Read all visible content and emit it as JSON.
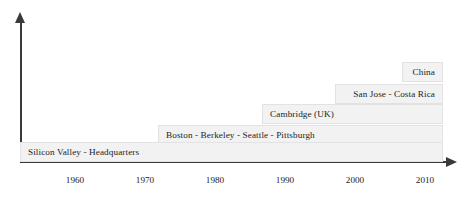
{
  "chart_data": {
    "type": "bar",
    "title": "",
    "xlabel": "",
    "ylabel": "",
    "orientation": "horizontal-stacked-staircase",
    "grid": false,
    "legend": false,
    "xlim": [
      1955,
      2015
    ],
    "x_ticks": [
      "1960",
      "1970",
      "1980",
      "1990",
      "2000",
      "2010"
    ],
    "categories": [
      "Silicon Valley - Headquarters",
      "Boston - Berkeley - Seattle - Pittsburgh",
      "Cambridge (UK)",
      "San Jose - Costa Rica",
      "China"
    ],
    "series": [
      {
        "name": "expansion-bands",
        "values": [
          {
            "label": "Silicon Valley - Headquarters",
            "start_year": 1955,
            "end_year": 2015,
            "level": 1
          },
          {
            "label": "Boston - Berkeley - Seattle - Pittsburgh",
            "start_year": 1974,
            "end_year": 2015,
            "level": 2
          },
          {
            "label": "Cambridge (UK)",
            "start_year": 1989,
            "end_year": 2015,
            "level": 3
          },
          {
            "label": "San Jose - Costa Rica",
            "start_year": 2000,
            "end_year": 2015,
            "level": 4
          },
          {
            "label": "China",
            "start_year": 2010,
            "end_year": 2015,
            "level": 5
          }
        ]
      }
    ],
    "colors": {
      "band_fill": "#f2f2f2",
      "band_border": "#e2e2e2",
      "axis": "#3a3a3a",
      "text": "#1d1d1d",
      "background": "#ffffff"
    }
  },
  "axes": {
    "x_axis_name": "time-axis",
    "y_axis_name": "value-axis",
    "ticks": [
      {
        "label": "1960",
        "x": 75
      },
      {
        "label": "1970",
        "x": 145
      },
      {
        "label": "1980",
        "x": 215
      },
      {
        "label": "1990",
        "x": 285
      },
      {
        "label": "2000",
        "x": 355
      },
      {
        "label": "2010",
        "x": 425
      }
    ]
  },
  "bands": [
    {
      "label": "China",
      "left": 402,
      "right": 443,
      "top": 62,
      "align": "right"
    },
    {
      "label": "San Jose - Costa Rica",
      "left": 335,
      "right": 443,
      "top": 84,
      "align": "right"
    },
    {
      "label": "Cambridge (UK)",
      "left": 262,
      "right": 443,
      "top": 104,
      "align": "left"
    },
    {
      "label": "Boston - Berkeley - Seattle - Pittsburgh",
      "left": 158,
      "right": 443,
      "top": 125,
      "align": "left"
    },
    {
      "label": "Silicon Valley - Headquarters",
      "left": 20,
      "right": 443,
      "top": 142,
      "align": "left"
    }
  ]
}
